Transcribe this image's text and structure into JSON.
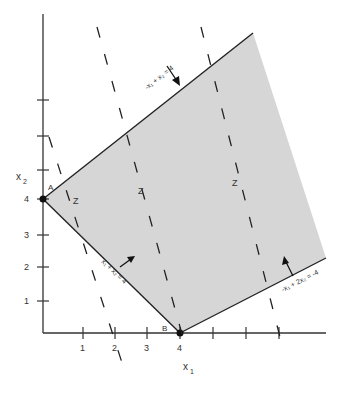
{
  "diagram": {
    "type": "linear-programming-feasible-region",
    "axes": {
      "x_label": "x",
      "x_label_sub": "1",
      "y_label": "x",
      "y_label_sub": "2",
      "x_ticks": [
        "1",
        "2",
        "3",
        "4"
      ],
      "y_ticks": [
        "1",
        "2",
        "3",
        "4"
      ]
    },
    "points": {
      "A": {
        "label": "A",
        "x": 0,
        "y": 4
      },
      "B": {
        "label": "B",
        "x": 4,
        "y": 0
      }
    },
    "constraints": [
      {
        "id": "upper",
        "text": "-x₁ + x₂ = 4",
        "arrow": "down-right"
      },
      {
        "id": "lower-left",
        "text": "x₁ + x₂ = 4",
        "arrow": "up-right"
      },
      {
        "id": "lower-right",
        "text": "-x₁ + 2x₂ = -4",
        "arrow": "up"
      }
    ],
    "objective_label": "Z",
    "objective_lines_count": 4,
    "colors": {
      "feasible_region": "#d6d6d6",
      "lines": "#222222"
    }
  }
}
